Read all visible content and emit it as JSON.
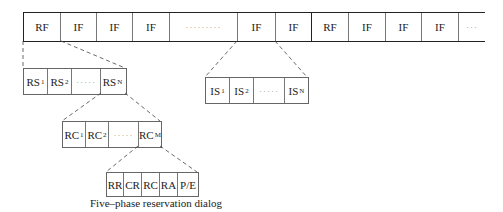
{
  "top_frame": {
    "cells": [
      {
        "label": "RF",
        "kind": "rf"
      },
      {
        "label": "IF",
        "kind": "if"
      },
      {
        "label": "IF",
        "kind": "if"
      },
      {
        "label": "IF",
        "kind": "if"
      },
      {
        "label": "·········",
        "kind": "dots"
      },
      {
        "label": "IF",
        "kind": "if"
      },
      {
        "label": "IF",
        "kind": "if"
      },
      {
        "label": "RF",
        "kind": "rf"
      },
      {
        "label": "IF",
        "kind": "if"
      },
      {
        "label": "IF",
        "kind": "if"
      },
      {
        "label": "IF",
        "kind": "if"
      },
      {
        "label": "···",
        "kind": "dots"
      }
    ]
  },
  "rs_row": {
    "cells": [
      {
        "base": "RS",
        "sub": "1"
      },
      {
        "base": "RS",
        "sub": "2"
      },
      {
        "base": "·····",
        "sub": ""
      },
      {
        "base": "RS",
        "sub": "N"
      }
    ]
  },
  "is_row": {
    "cells": [
      {
        "base": "IS",
        "sub": "1"
      },
      {
        "base": "IS",
        "sub": "2"
      },
      {
        "base": "·····",
        "sub": ""
      },
      {
        "base": "IS",
        "sub": "N"
      }
    ]
  },
  "rc_row": {
    "cells": [
      {
        "base": "RC",
        "sub": "1"
      },
      {
        "base": "RC",
        "sub": "2"
      },
      {
        "base": "·····",
        "sub": ""
      },
      {
        "base": "RC",
        "sub": "M"
      }
    ]
  },
  "dialog_row": {
    "cells": [
      "RR",
      "CR",
      "RC",
      "RA",
      "P/E"
    ],
    "caption": "Five–phase reservation dialog"
  }
}
